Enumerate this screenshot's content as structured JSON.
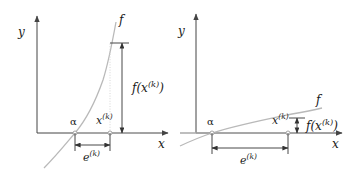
{
  "figure": {
    "background_color": "#ffffff",
    "curve_color": "#b9b9b9",
    "axis_color": "#444444",
    "annotation_color": "#333333",
    "width": 358,
    "height": 172
  },
  "panels": [
    {
      "id": "left",
      "description": "steep function: small error, large residual",
      "axis": {
        "y_label": "y",
        "x_label": "x",
        "origin": {
          "x": 37,
          "y": 133
        },
        "x_axis_end": 168,
        "y_axis_top": 16
      },
      "curve_label": "f",
      "points": {
        "alpha_label": "α",
        "alpha_x": 75,
        "xk_label_base": "x",
        "xk_label_sup": "(k)",
        "xk_x": 110
      },
      "annotations": {
        "error_label_base": "e",
        "error_label_sup": "(k)",
        "error_span": [
          75,
          110
        ],
        "error_y": 145,
        "residual_label_base": "f(x",
        "residual_label_sup": "(k)",
        "residual_label_tail": ")",
        "residual_span_y": [
          43,
          133
        ],
        "residual_x": 122
      }
    },
    {
      "id": "right",
      "description": "shallow function: large error, small residual",
      "axis": {
        "y_label": "y",
        "x_label": "x",
        "origin": {
          "x": 196,
          "y": 133
        },
        "x_axis_end": 342,
        "y_axis_top": 14
      },
      "curve_label": "f",
      "points": {
        "alpha_label": "α",
        "alpha_x": 212,
        "xk_label_base": "x",
        "xk_label_sup": "(k)",
        "xk_x": 288
      },
      "annotations": {
        "error_label_base": "e",
        "error_label_sup": "(k)",
        "error_span": [
          212,
          288
        ],
        "error_y": 148,
        "residual_label_base": "f(x",
        "residual_label_sup": "(k)",
        "residual_label_tail": ")",
        "residual_span_y": [
          118,
          133
        ],
        "residual_x": 297
      }
    }
  ]
}
